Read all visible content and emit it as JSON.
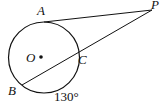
{
  "diagram": {
    "labels": {
      "A": "A",
      "P": "P",
      "O": "O",
      "C": "C",
      "B": "B"
    },
    "arc_measure": "130°"
  }
}
